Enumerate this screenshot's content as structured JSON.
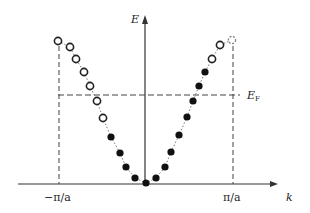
{
  "diagram": {
    "type": "band-structure",
    "labels": {
      "y_axis": "E",
      "x_axis": "k",
      "fermi_level": "E",
      "fermi_level_sub": "F",
      "left_boundary": "−π/a",
      "right_boundary": "π/a"
    },
    "colors": {
      "axis": "#333333",
      "dashed": "#444444",
      "filled_point": "#111111",
      "open_point_stroke": "#222222",
      "boundary_point_stroke": "#888888"
    },
    "points": [
      {
        "x": 58,
        "y": 41,
        "state": "empty"
      },
      {
        "x": 70,
        "y": 47,
        "state": "empty"
      },
      {
        "x": 76,
        "y": 59,
        "state": "empty"
      },
      {
        "x": 84,
        "y": 72,
        "state": "empty"
      },
      {
        "x": 90,
        "y": 86,
        "state": "empty"
      },
      {
        "x": 97,
        "y": 101,
        "state": "empty"
      },
      {
        "x": 103,
        "y": 118,
        "state": "empty"
      },
      {
        "x": 111,
        "y": 137,
        "state": "filled"
      },
      {
        "x": 120,
        "y": 153,
        "state": "filled"
      },
      {
        "x": 126,
        "y": 167,
        "state": "filled"
      },
      {
        "x": 135,
        "y": 178,
        "state": "filled"
      },
      {
        "x": 146,
        "y": 183,
        "state": "filled"
      },
      {
        "x": 156,
        "y": 178,
        "state": "filled"
      },
      {
        "x": 165,
        "y": 167,
        "state": "filled"
      },
      {
        "x": 171,
        "y": 152,
        "state": "filled"
      },
      {
        "x": 179,
        "y": 135,
        "state": "filled"
      },
      {
        "x": 187,
        "y": 117,
        "state": "filled"
      },
      {
        "x": 193,
        "y": 101,
        "state": "filled"
      },
      {
        "x": 199,
        "y": 86,
        "state": "filled"
      },
      {
        "x": 205,
        "y": 72,
        "state": "filled"
      },
      {
        "x": 212,
        "y": 59,
        "state": "empty"
      },
      {
        "x": 220,
        "y": 45,
        "state": "empty"
      },
      {
        "x": 232,
        "y": 40,
        "state": "boundary"
      }
    ]
  }
}
